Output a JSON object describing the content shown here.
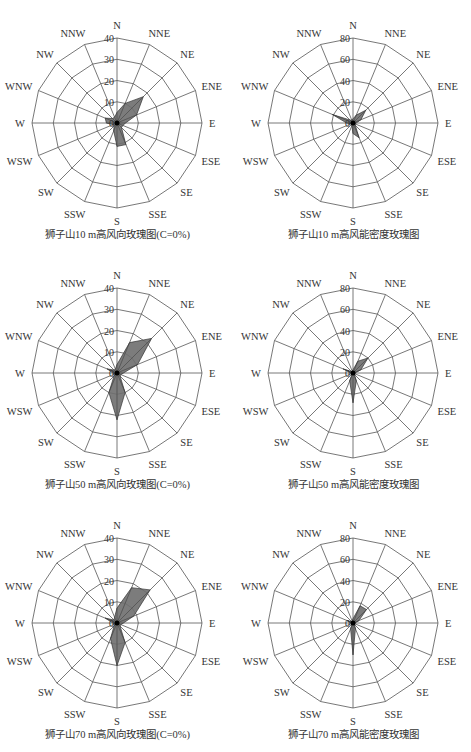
{
  "directions": [
    "N",
    "NNE",
    "NE",
    "ENE",
    "E",
    "ESE",
    "SE",
    "SSE",
    "S",
    "SSW",
    "SW",
    "WSW",
    "W",
    "WNW",
    "NW",
    "NNW"
  ],
  "style": {
    "grid_color": "#555555",
    "fill_color": "#6e6e6e",
    "fill_opacity": 0.9,
    "center_dot": "#000000"
  },
  "chart_data": [
    {
      "type": "radar",
      "title": "狮子山10 m高风向玫瑰图(C=0%)",
      "kind": "wind direction frequency (%)",
      "rings": [
        0,
        10,
        20,
        30,
        40
      ],
      "rmax": 40,
      "categories": [
        "N",
        "NNE",
        "NE",
        "ENE",
        "E",
        "ESE",
        "SE",
        "SSE",
        "S",
        "SSW",
        "SW",
        "WSW",
        "W",
        "WNW",
        "NW",
        "NNW"
      ],
      "values": [
        5,
        10,
        17.5,
        10,
        4,
        3,
        3,
        11,
        11,
        4,
        2,
        2,
        5,
        6,
        3,
        3
      ]
    },
    {
      "type": "radar",
      "title": "狮子山10 m高风能密度玫瑰图",
      "kind": "wind energy density",
      "rings": [
        0,
        20,
        40,
        60,
        80
      ],
      "rmax": 80,
      "categories": [
        "N",
        "NNE",
        "NE",
        "ENE",
        "E",
        "ESE",
        "SE",
        "SSE",
        "S",
        "SSW",
        "SW",
        "WSW",
        "W",
        "WNW",
        "NW",
        "NNW"
      ],
      "values": [
        4,
        8,
        17,
        8,
        3,
        2,
        3,
        15,
        10,
        3,
        1,
        2,
        6,
        21,
        4,
        3
      ]
    },
    {
      "type": "radar",
      "title": "狮子山50 m高风向玫瑰图(C=0%)",
      "kind": "wind direction frequency (%)",
      "rings": [
        0,
        10,
        20,
        30,
        40
      ],
      "rmax": 40,
      "categories": [
        "N",
        "NNE",
        "NE",
        "ENE",
        "E",
        "ESE",
        "SE",
        "SSE",
        "S",
        "SSW",
        "SW",
        "WSW",
        "W",
        "WNW",
        "NW",
        "NNW"
      ],
      "values": [
        4,
        15.5,
        23,
        10.5,
        3,
        2,
        2,
        10,
        22,
        10,
        2,
        1,
        2,
        5,
        2,
        2
      ]
    },
    {
      "type": "radar",
      "title": "狮子山50 m高风能密度玫瑰图",
      "kind": "wind energy density",
      "rings": [
        0,
        20,
        40,
        60,
        80
      ],
      "rmax": 80,
      "categories": [
        "N",
        "NNE",
        "NE",
        "ENE",
        "E",
        "ESE",
        "SE",
        "SSE",
        "S",
        "SSW",
        "SW",
        "WSW",
        "W",
        "WNW",
        "NW",
        "NNW"
      ],
      "values": [
        3,
        12,
        20,
        8,
        2,
        1,
        2,
        8,
        28,
        8,
        1,
        1,
        2,
        10,
        2,
        2
      ]
    },
    {
      "type": "radar",
      "title": "狮子山70 m高风向玫瑰图(C=0%)",
      "kind": "wind direction frequency (%)",
      "rings": [
        0,
        10,
        20,
        30,
        40
      ],
      "rmax": 40,
      "categories": [
        "N",
        "NNE",
        "NE",
        "ENE",
        "E",
        "ESE",
        "SE",
        "SSE",
        "S",
        "SSW",
        "SW",
        "WSW",
        "W",
        "WNW",
        "NW",
        "NNW"
      ],
      "values": [
        7,
        18,
        22,
        8.5,
        3,
        2,
        2,
        10,
        20,
        8,
        2,
        1,
        2,
        6,
        2,
        3
      ]
    },
    {
      "type": "radar",
      "title": "狮子山70 m高风能密度玫瑰图",
      "kind": "wind energy density",
      "rings": [
        0,
        20,
        40,
        60,
        80
      ],
      "rmax": 80,
      "categories": [
        "N",
        "NNE",
        "NE",
        "ENE",
        "E",
        "ESE",
        "SE",
        "SSE",
        "S",
        "SSW",
        "SW",
        "WSW",
        "W",
        "WNW",
        "NW",
        "NNW"
      ],
      "values": [
        4,
        17.5,
        18,
        6,
        2,
        1,
        2,
        6,
        30,
        6,
        1,
        1,
        2,
        6,
        2,
        2
      ]
    }
  ]
}
